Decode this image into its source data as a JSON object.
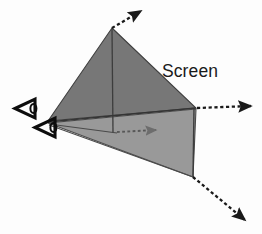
{
  "diagram": {
    "background_color": "#fdfdfd",
    "labels": {
      "screen": "Screen"
    },
    "colors": {
      "upper_plane_fill": "#777777",
      "lower_plane_fill": "#999999",
      "outline": "#3a3a3a",
      "arrow_dark": "#1a1a1a",
      "arrow_gray": "#6d6d6d",
      "eye_icon": "#0d0d0d",
      "label_text": "#1a1a1a"
    },
    "viewpoints": [
      {
        "name": "upper-viewpoint",
        "icon": "eye-icon",
        "x": 26,
        "y": 105,
        "direction": "right"
      },
      {
        "name": "lower-viewpoint",
        "icon": "eye-icon",
        "x": 46,
        "y": 125,
        "direction": "right"
      }
    ],
    "planes": [
      {
        "name": "upper-screen-plane",
        "shade": "dark",
        "points": "112,28 196,108 48,121"
      },
      {
        "name": "lower-screen-plane",
        "shade": "light",
        "points": "48,123 196,109 193,177"
      }
    ],
    "rays": [
      {
        "name": "top-ray",
        "style": "dashed",
        "color": "dark",
        "from_x": 112,
        "from_y": 28,
        "to_x": 141,
        "to_y": 11
      },
      {
        "name": "middle-right-ray",
        "style": "dashed",
        "color": "dark",
        "from_x": 197,
        "from_y": 108,
        "to_x": 253,
        "to_y": 106
      },
      {
        "name": "center-ray",
        "style": "dashed",
        "color": "gray",
        "from_x": 117,
        "from_y": 132,
        "to_x": 158,
        "to_y": 130
      },
      {
        "name": "bottom-ray",
        "style": "dashed",
        "color": "dark",
        "from_x": 193,
        "from_y": 177,
        "to_x": 247,
        "to_y": 222
      }
    ],
    "edges": [
      {
        "name": "apex-vertical-edge",
        "x1": 112,
        "y1": 29,
        "x2": 113,
        "y2": 133
      },
      {
        "name": "right-vertical-edge",
        "x1": 194,
        "y1": 108,
        "x2": 193,
        "y2": 177
      },
      {
        "name": "horizon-edge",
        "x1": 48,
        "y1": 122,
        "x2": 196,
        "y2": 108
      },
      {
        "name": "center-spoke-edge",
        "x1": 49,
        "y1": 124,
        "x2": 117,
        "y2": 133
      },
      {
        "name": "lower-diagonal-edge",
        "x1": 49,
        "y1": 125,
        "x2": 193,
        "y2": 177
      }
    ]
  }
}
